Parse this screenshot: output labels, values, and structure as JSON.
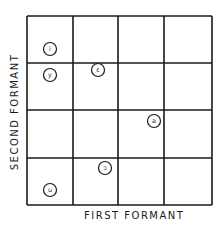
{
  "diagram": {
    "x_axis_label": "FIRST FORMANT",
    "y_axis_label": "SECOND FORMANT",
    "grid": {
      "columns": 4,
      "rows": 4,
      "line_color": "#1a1a1a"
    },
    "vowels": [
      {
        "symbol": "i",
        "x": 50,
        "y": 49
      },
      {
        "symbol": "y",
        "x": 50,
        "y": 75
      },
      {
        "symbol": "ε",
        "x": 98,
        "y": 70
      },
      {
        "symbol": "a",
        "x": 154,
        "y": 121
      },
      {
        "symbol": "ɔ",
        "x": 105,
        "y": 168
      },
      {
        "symbol": "u",
        "x": 50,
        "y": 190
      }
    ]
  }
}
